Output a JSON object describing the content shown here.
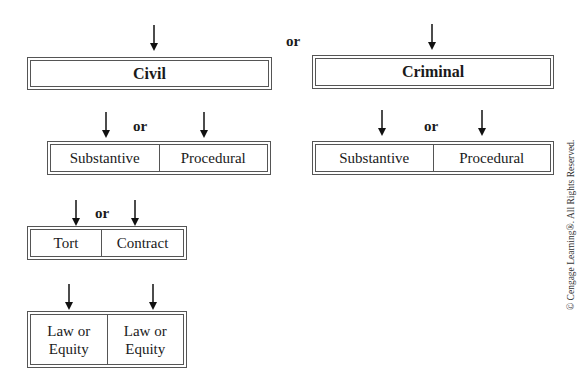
{
  "diagram": {
    "top_connector": "or",
    "level1": [
      {
        "label": "Civil"
      },
      {
        "label": "Criminal"
      }
    ],
    "level2": {
      "civil": {
        "connector": "or",
        "cells": [
          "Substantive",
          "Procedural"
        ]
      },
      "criminal": {
        "connector": "or",
        "cells": [
          "Substantive",
          "Procedural"
        ]
      }
    },
    "level3": {
      "connector": "or",
      "cells": [
        "Tort",
        "Contract"
      ]
    },
    "level4": {
      "cells": [
        "Law or Equity",
        "Law or Equity"
      ]
    }
  },
  "copyright": "© Cengage Learning®. All Rights Reserved."
}
